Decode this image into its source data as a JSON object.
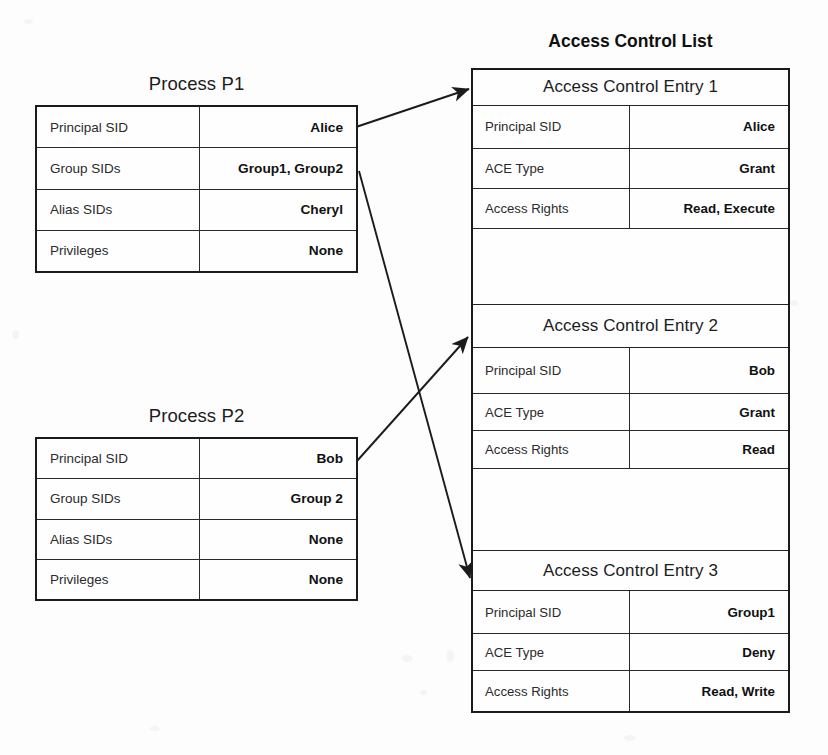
{
  "diagram": {
    "processes": [
      {
        "title": "Process P1",
        "rows": [
          {
            "key": "Principal SID",
            "value": "Alice"
          },
          {
            "key": "Group SIDs",
            "value": "Group1, Group2"
          },
          {
            "key": "Alias SIDs",
            "value": "Cheryl"
          },
          {
            "key": "Privileges",
            "value": "None"
          }
        ]
      },
      {
        "title": "Process P2",
        "rows": [
          {
            "key": "Principal SID",
            "value": "Bob"
          },
          {
            "key": "Group SIDs",
            "value": "Group 2"
          },
          {
            "key": "Alias SIDs",
            "value": "None"
          },
          {
            "key": "Privileges",
            "value": "None"
          }
        ]
      }
    ],
    "acl": {
      "title": "Access Control List",
      "entries": [
        {
          "header": "Access Control Entry 1",
          "rows": [
            {
              "key": "Principal SID",
              "value": "Alice"
            },
            {
              "key": "ACE Type",
              "value": "Grant"
            },
            {
              "key": "Access Rights",
              "value": "Read, Execute"
            }
          ]
        },
        {
          "header": "Access Control Entry 2",
          "rows": [
            {
              "key": "Principal SID",
              "value": "Bob"
            },
            {
              "key": "ACE Type",
              "value": "Grant"
            },
            {
              "key": "Access Rights",
              "value": "Read"
            }
          ]
        },
        {
          "header": "Access Control Entry 3",
          "rows": [
            {
              "key": "Principal SID",
              "value": "Group1"
            },
            {
              "key": "ACE Type",
              "value": "Deny"
            },
            {
              "key": "Access Rights",
              "value": "Read, Write"
            }
          ]
        }
      ]
    },
    "connectors": [
      {
        "name": "p1-principal-sid-to-ace1",
        "from": "Process P1 / Principal SID",
        "to": "Access Control Entry 1"
      },
      {
        "name": "p2-principal-sid-to-ace2",
        "from": "Process P2 / Principal SID",
        "to": "Access Control Entry 2"
      },
      {
        "name": "p1-group-sids-to-ace3",
        "from": "Process P1 / Group SIDs",
        "to": "Access Control Entry 3"
      }
    ],
    "colors": {
      "background": "#fdfdfd",
      "stroke": "#1b1b1b",
      "text": "#1a1a1a"
    }
  }
}
